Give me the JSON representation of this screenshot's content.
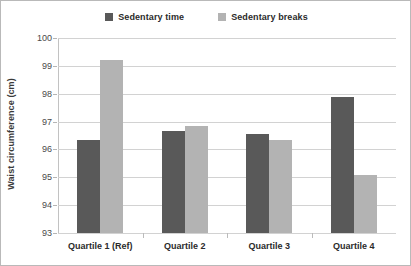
{
  "chart_data": {
    "type": "bar",
    "title": "",
    "subtitle": "",
    "xlabel": "",
    "ylabel": "Waist circumference (cm)",
    "categories": [
      "Quartile 1 (Ref)",
      "Quartile 2",
      "Quartile 3",
      "Quartile 4"
    ],
    "series": [
      {
        "name": "Sedentary time",
        "color": "#595959",
        "values": [
          96.35,
          96.65,
          96.55,
          97.9
        ]
      },
      {
        "name": "Sedentary breaks",
        "color": "#b3b3b3",
        "values": [
          99.2,
          96.85,
          96.35,
          95.1
        ]
      }
    ],
    "ylim": [
      93,
      100
    ],
    "yticks": [
      93,
      94,
      95,
      96,
      97,
      98,
      99,
      100
    ],
    "ytick_labels": [
      "93",
      "94",
      "95",
      "96",
      "97",
      "98",
      "99",
      "100"
    ],
    "grid": true,
    "legend_position": "top-center",
    "plot_background": "#ffffff",
    "grid_color": "#d2d2d2",
    "border_color": "#b9b9b9"
  },
  "legend": {
    "entries": [
      {
        "label": "Sedentary time",
        "color": "#595959"
      },
      {
        "label": "Sedentary breaks",
        "color": "#b3b3b3"
      }
    ]
  },
  "axes": {
    "y_title": "Waist circumference (cm)"
  }
}
